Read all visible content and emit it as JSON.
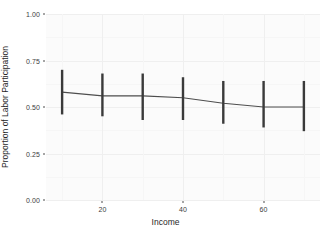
{
  "chart_data": {
    "type": "line",
    "title": "",
    "subtitle": "",
    "xlabel": "Income",
    "ylabel": "Proportion of Labor Participation",
    "x": [
      10,
      20,
      30,
      40,
      50,
      60,
      70
    ],
    "values": [
      0.58,
      0.56,
      0.56,
      0.55,
      0.52,
      0.5,
      0.5
    ],
    "error_low": [
      0.46,
      0.45,
      0.43,
      0.43,
      0.41,
      0.39,
      0.37
    ],
    "error_high": [
      0.7,
      0.68,
      0.68,
      0.66,
      0.64,
      0.64,
      0.64
    ],
    "series": [
      {
        "name": "Predicted proportion",
        "values": [
          0.58,
          0.56,
          0.56,
          0.55,
          0.52,
          0.5,
          0.5
        ]
      }
    ],
    "xlim": [
      6,
      74
    ],
    "ylim": [
      0.0,
      1.0
    ],
    "x_ticks": [
      20,
      40,
      60
    ],
    "x_tick_labels": [
      "20",
      "40",
      "60"
    ],
    "y_ticks": [
      0.0,
      0.25,
      0.5,
      0.75,
      1.0
    ],
    "y_tick_labels": [
      "0.00",
      "0.25",
      "0.50",
      "0.75",
      "1.00"
    ],
    "grid": true,
    "legend": "none",
    "error_bar_style": "vertical-interval",
    "colors": {
      "line": "#4d4d4d",
      "error_bar": "#3a3a3a",
      "panel_background": "#fbfbfb",
      "grid_major": "#efefef",
      "grid_minor": "#f6f6f6",
      "text": "#2b2b2b",
      "page_background": "#ffffff"
    }
  }
}
